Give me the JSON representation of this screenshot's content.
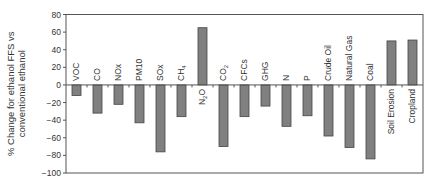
{
  "chart_data": {
    "type": "bar",
    "title": "",
    "xlabel": "",
    "ylabel": "% Change for ethanol FFS vs conventional ethanol",
    "ylabel_lines": [
      "% Change for ethanol FFS vs",
      "conventional ethanol"
    ],
    "ylim": [
      -100,
      80
    ],
    "yticks": [
      80,
      60,
      40,
      20,
      0,
      -20,
      -40,
      -60,
      -80,
      -100
    ],
    "grid": false,
    "legend": null,
    "bar_color": "#808080",
    "categories": [
      "VOC",
      "CO",
      "NOx",
      "PM10",
      "SOx",
      "CH4",
      "N2O",
      "CO2",
      "CFCs",
      "GHG",
      "N",
      "P",
      "Crude Oil",
      "Natural Gas",
      "Coal",
      "Soil Erosion",
      "Cropland"
    ],
    "category_display": [
      {
        "base": "VOC",
        "sub": ""
      },
      {
        "base": "CO",
        "sub": ""
      },
      {
        "base": "NOx",
        "sub": ""
      },
      {
        "base": "PM10",
        "sub": ""
      },
      {
        "base": "SOx",
        "sub": ""
      },
      {
        "base": "CH",
        "sub": "4"
      },
      {
        "base": "N",
        "sub": "2",
        "tail": "O"
      },
      {
        "base": "CO",
        "sub": "2"
      },
      {
        "base": "CFCs",
        "sub": ""
      },
      {
        "base": "GHG",
        "sub": ""
      },
      {
        "base": "N",
        "sub": ""
      },
      {
        "base": "P",
        "sub": ""
      },
      {
        "base": "Crude Oil",
        "sub": ""
      },
      {
        "base": "Natural Gas",
        "sub": ""
      },
      {
        "base": "Coal",
        "sub": ""
      },
      {
        "base": "Soil Erosion",
        "sub": ""
      },
      {
        "base": "Cropland",
        "sub": ""
      }
    ],
    "values": [
      -12,
      -32,
      -22,
      -43,
      -76,
      -36,
      65,
      -70,
      -36,
      -24,
      -47,
      -35,
      -58,
      -71,
      -84,
      50,
      51
    ]
  }
}
